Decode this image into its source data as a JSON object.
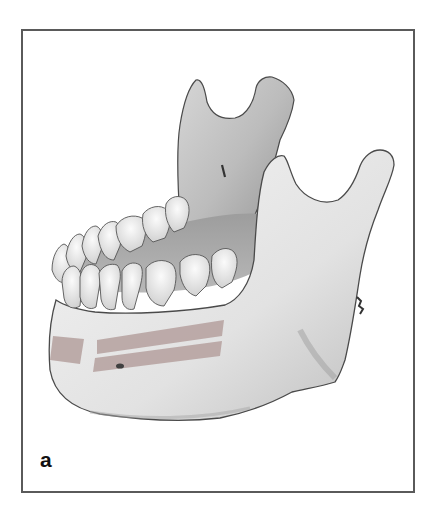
{
  "figure": {
    "panel_label": "a",
    "view": "oblique lateral view of mandible with lower and upper dentition",
    "highlighted_regions": [
      {
        "name": "chin-band",
        "color": "#b9a6a4"
      },
      {
        "name": "upper-body-band",
        "color": "#b9a6a4"
      },
      {
        "name": "lower-body-band",
        "color": "#b9a6a4"
      }
    ],
    "colors": {
      "frame_border": "#5a5a5a",
      "bone_light": "#f2f2f2",
      "bone_mid": "#d4d4d4",
      "bone_shadow": "#9a9a9a",
      "outline": "#4a4a4a",
      "band": "#b9a6a4",
      "label": "#111111"
    }
  }
}
